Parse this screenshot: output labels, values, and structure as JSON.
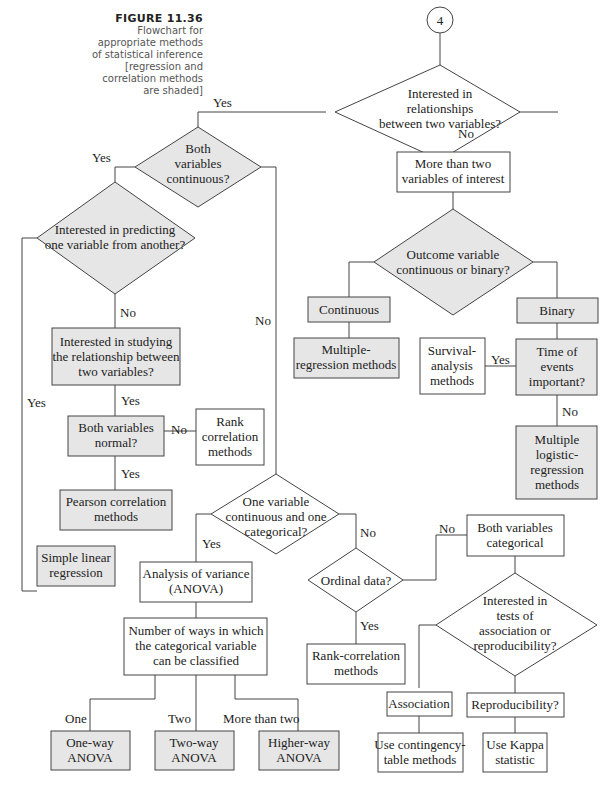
{
  "figure": {
    "number": "FIGURE 11.36",
    "caption_lines": [
      "Flowchart for",
      "appropriate methods",
      "of statistical inference",
      "[regression and",
      "correlation methods",
      "are shaded]"
    ]
  },
  "colors": {
    "shaded_fill": "#e6e6e6",
    "plain_fill": "#ffffff",
    "stroke": "#444444"
  },
  "connector": {
    "label": "4"
  },
  "nodes": {
    "relationships": {
      "type": "decision",
      "shaded": false,
      "lines": [
        "Interested in",
        "relationships",
        "between two variables?"
      ]
    },
    "both_continuous": {
      "type": "decision",
      "shaded": true,
      "lines": [
        "Both",
        "variables",
        "continuous?"
      ]
    },
    "predicting": {
      "type": "decision",
      "shaded": true,
      "lines": [
        "Interested in predicting",
        "one variable from another?"
      ]
    },
    "studying_relationship": {
      "type": "process",
      "shaded": true,
      "lines": [
        "Interested in studying",
        "the relationship between",
        "two variables?"
      ]
    },
    "both_normal": {
      "type": "process",
      "shaded": true,
      "lines": [
        "Both variables",
        "normal?"
      ]
    },
    "rank_correlation": {
      "type": "process",
      "shaded": false,
      "lines": [
        "Rank",
        "correlation",
        "methods"
      ]
    },
    "pearson": {
      "type": "process",
      "shaded": true,
      "lines": [
        "Pearson correlation",
        "methods"
      ]
    },
    "simple_linear": {
      "type": "process",
      "shaded": true,
      "lines": [
        "Simple linear",
        "regression"
      ]
    },
    "more_than_two": {
      "type": "process",
      "shaded": false,
      "lines": [
        "More than two",
        "variables of interest"
      ]
    },
    "outcome": {
      "type": "decision",
      "shaded": true,
      "lines": [
        "Outcome variable",
        "continuous or binary?"
      ]
    },
    "continuous": {
      "type": "process",
      "shaded": true,
      "lines": [
        "Continuous"
      ]
    },
    "binary": {
      "type": "process",
      "shaded": true,
      "lines": [
        "Binary"
      ]
    },
    "multiple_regression": {
      "type": "process",
      "shaded": true,
      "lines": [
        "Multiple-",
        "regression methods"
      ]
    },
    "survival": {
      "type": "process",
      "shaded": false,
      "lines": [
        "Survival-",
        "analysis",
        "methods"
      ]
    },
    "time_events": {
      "type": "process",
      "shaded": true,
      "lines": [
        "Time of",
        "events",
        "important?"
      ]
    },
    "logistic": {
      "type": "process",
      "shaded": true,
      "lines": [
        "Multiple",
        "logistic-",
        "regression",
        "methods"
      ]
    },
    "one_cont_one_cat": {
      "type": "decision",
      "shaded": false,
      "lines": [
        "One variable",
        "continuous and one",
        "categorical?"
      ]
    },
    "anova": {
      "type": "process",
      "shaded": false,
      "lines": [
        "Analysis of variance",
        "(ANOVA)"
      ]
    },
    "num_ways": {
      "type": "process",
      "shaded": false,
      "lines": [
        "Number of ways in which",
        "the categorical variable",
        "can be classified"
      ]
    },
    "one_way": {
      "type": "process",
      "shaded": true,
      "lines": [
        "One-way",
        "ANOVA"
      ]
    },
    "two_way": {
      "type": "process",
      "shaded": true,
      "lines": [
        "Two-way",
        "ANOVA"
      ]
    },
    "higher_way": {
      "type": "process",
      "shaded": true,
      "lines": [
        "Higher-way",
        "ANOVA"
      ]
    },
    "ordinal": {
      "type": "decision",
      "shaded": false,
      "lines": [
        "Ordinal data?"
      ]
    },
    "rank_corr2": {
      "type": "process",
      "shaded": false,
      "lines": [
        "Rank-correlation",
        "methods"
      ]
    },
    "both_categorical": {
      "type": "process",
      "shaded": false,
      "lines": [
        "Both variables",
        "categorical"
      ]
    },
    "assoc_repro": {
      "type": "decision",
      "shaded": false,
      "lines": [
        "Interested in",
        "tests of",
        "association or",
        "reproducibility?"
      ]
    },
    "association": {
      "type": "process",
      "shaded": false,
      "lines": [
        "Association"
      ]
    },
    "reproducibility": {
      "type": "process",
      "shaded": false,
      "lines": [
        "Reproducibility?"
      ]
    },
    "contingency": {
      "type": "process",
      "shaded": false,
      "lines": [
        "Use contingency-",
        "table methods"
      ]
    },
    "kappa": {
      "type": "process",
      "shaded": false,
      "lines": [
        "Use Kappa",
        "statistic"
      ]
    }
  },
  "edge_labels": {
    "rel_yes": "Yes",
    "rel_no": "No",
    "cont_yes": "Yes",
    "cont_no": "No",
    "pred_no": "No",
    "pred_yes": "Yes",
    "study_yes": "Yes",
    "normal_no": "No",
    "normal_yes": "Yes",
    "time_yes": "Yes",
    "time_no": "No",
    "onecat_yes": "Yes",
    "onecat_no": "No",
    "ordinal_no": "No",
    "ordinal_yes": "Yes",
    "ways_one": "One",
    "ways_two": "Two",
    "ways_more": "More than two"
  }
}
